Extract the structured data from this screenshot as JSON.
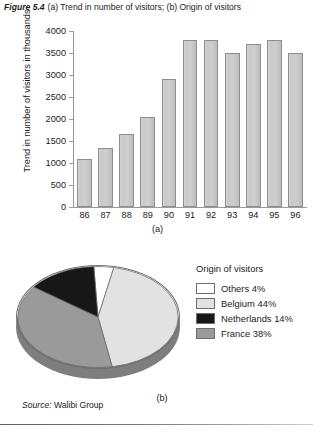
{
  "caption": {
    "figure_number": "Figure 5.4",
    "text": "(a) Trend in number of visitors; (b) Origin of visitors"
  },
  "bar_chart": {
    "ylabel": "Trend in number of visitors in thousands",
    "sub_caption": "(a)"
  },
  "pie": {
    "legend_title": "Origin of visitors",
    "sub_caption": "(b)"
  },
  "source": {
    "key": "Source:",
    "value": "Walibi Group"
  },
  "chart_data": [
    {
      "type": "bar",
      "title": "",
      "xlabel": "",
      "ylabel": "Trend in number of visitors in thousands",
      "categories": [
        "86",
        "87",
        "88",
        "89",
        "90",
        "91",
        "92",
        "93",
        "94",
        "95",
        "96"
      ],
      "values": [
        1100,
        1350,
        1650,
        2050,
        2900,
        3800,
        3800,
        3500,
        3700,
        3800,
        3500
      ],
      "ylim": [
        0,
        4000
      ],
      "yticks": [
        0,
        500,
        1000,
        1500,
        2000,
        2500,
        3000,
        3500,
        4000
      ],
      "grid": false,
      "legend": "none",
      "bar_fill": "#c9c9c9",
      "bar_border": "#8e8e8e",
      "axis_color": "#9a9a9a"
    },
    {
      "type": "pie",
      "title": "Origin of visitors",
      "legend_position": "right",
      "three_d": true,
      "labels": [
        "Others",
        "Belgium",
        "Netherlands",
        "France"
      ],
      "values": [
        4,
        44,
        14,
        38
      ],
      "display_labels": [
        "Others 4%",
        "Belgium 44%",
        "Netherlands 14%",
        "France 38%"
      ],
      "colors": [
        "#ffffff",
        "#e2e2e2",
        "#171717",
        "#9a9a9a"
      ]
    }
  ]
}
